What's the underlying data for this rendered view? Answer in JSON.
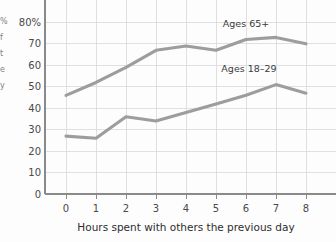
{
  "chart_data": {
    "type": "line",
    "title": "",
    "xlabel": "Hours spent with others the previous day",
    "ylabel": "",
    "x": [
      0,
      1,
      2,
      3,
      4,
      5,
      6,
      7,
      8
    ],
    "xticklabels": [
      "0",
      "1",
      "2",
      "3",
      "4",
      "5",
      "6",
      "7",
      "8"
    ],
    "yticks": [
      0,
      10,
      20,
      30,
      40,
      50,
      60,
      70,
      80
    ],
    "yticklabels": [
      "0",
      "10",
      "20",
      "30",
      "40",
      "50",
      "60",
      "70",
      "80%"
    ],
    "ylim": [
      0,
      85
    ],
    "xlim": [
      -0.3,
      8.4
    ],
    "grid": true,
    "legend_position": "inline-annotations",
    "series": [
      {
        "name": "Ages 65+",
        "values": [
          46,
          52,
          59,
          67,
          69,
          67,
          72,
          73,
          70
        ],
        "label": "Ages 65+",
        "label_x": 6.0,
        "label_y": 78,
        "color": "#9d9d9d"
      },
      {
        "name": "Ages 18–29",
        "values": [
          27,
          26,
          36,
          34,
          38,
          42,
          46,
          51,
          47
        ],
        "label": "Ages 18–29",
        "label_x": 6.1,
        "label_y": 57,
        "color": "#9d9d9d"
      }
    ]
  },
  "axis": {
    "y_tick_labels": [
      "80%",
      "70",
      "60",
      "50",
      "40",
      "30",
      "20",
      "10",
      "0"
    ],
    "x_tick_labels": [
      "0",
      "1",
      "2",
      "3",
      "4",
      "5",
      "6",
      "7",
      "8"
    ],
    "x_axis_title": "Hours spent with others the previous day"
  },
  "annotations": {
    "series_1_label": "Ages 65+",
    "series_2_label": "Ages 18–29"
  },
  "cropped_left_label": {
    "chars": [
      "%",
      "f",
      "t",
      "e",
      "y"
    ]
  },
  "colors": {
    "line": "#9d9d9d",
    "grid": "#d8d8dc",
    "axis": "#8a8a8a",
    "text": "#3a3a3a",
    "background": "#fdfdfd"
  }
}
